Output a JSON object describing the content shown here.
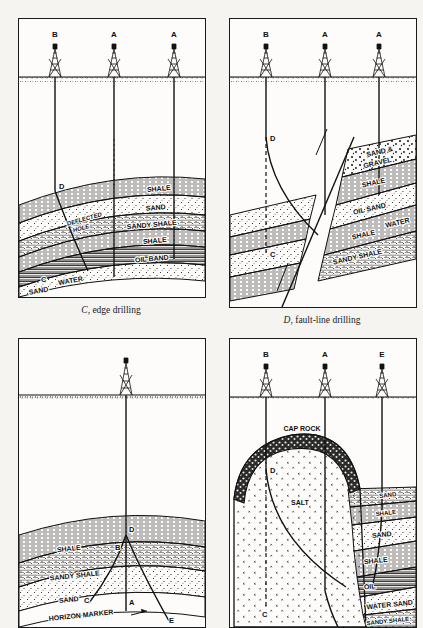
{
  "figure": {
    "kind": "geological-cross-section-plate",
    "panels": [
      {
        "id": "C",
        "caption_letter": "C",
        "caption_text": ", edge drilling",
        "wells": [
          {
            "label": "B",
            "type": "deflected"
          },
          {
            "label": "A",
            "type": "vertical"
          },
          {
            "label": "A",
            "type": "vertical"
          }
        ],
        "point_labels": [
          "D",
          "C"
        ],
        "annotations": [
          "DEFLECTED HOLE"
        ],
        "strata": [
          {
            "name": "SHALE",
            "pattern": "shale"
          },
          {
            "name": "SAND",
            "pattern": "sand"
          },
          {
            "name": "SANDY SHALE",
            "pattern": "sandy-shale"
          },
          {
            "name": "SHALE",
            "pattern": "shale"
          },
          {
            "name": "OIL BAND",
            "pattern": "oil"
          },
          {
            "name": "WATER",
            "pattern": "water"
          },
          {
            "name": "SAND",
            "pattern": "sand"
          }
        ]
      },
      {
        "id": "D",
        "caption_letter": "D",
        "caption_text": ", fault-line drilling",
        "wells": [
          {
            "label": "B",
            "type": "deflected"
          },
          {
            "label": "A",
            "type": "vertical"
          },
          {
            "label": "A",
            "type": "vertical"
          }
        ],
        "point_labels": [
          "D",
          "C"
        ],
        "annotations": [
          "fault plane"
        ],
        "strata": [
          {
            "name": "SAND & GRAVEL",
            "pattern": "gravel"
          },
          {
            "name": "SHALE",
            "pattern": "shale"
          },
          {
            "name": "OIL SAND",
            "pattern": "oil-sand"
          },
          {
            "name": "WATER",
            "pattern": "water"
          },
          {
            "name": "SHALE",
            "pattern": "shale"
          },
          {
            "name": "SANDY SHALE",
            "pattern": "sandy-shale"
          }
        ]
      },
      {
        "id": "E",
        "caption_letter": "",
        "caption_text": "",
        "wells": [
          {
            "label": "",
            "type": "multi-deflected"
          }
        ],
        "point_labels": [
          "D",
          "B",
          "C",
          "A",
          "E"
        ],
        "annotations": [
          "HORIZON MARKER"
        ],
        "strata": [
          {
            "name": "SHALE",
            "pattern": "shale"
          },
          {
            "name": "SANDY SHALE",
            "pattern": "sandy-shale"
          },
          {
            "name": "SAND",
            "pattern": "sand"
          }
        ]
      },
      {
        "id": "F",
        "caption_letter": "",
        "caption_text": "",
        "wells": [
          {
            "label": "B",
            "type": "deflected"
          },
          {
            "label": "A",
            "type": "vertical"
          },
          {
            "label": "E",
            "type": "vertical"
          }
        ],
        "point_labels": [
          "D",
          "C"
        ],
        "annotations": [],
        "strata": [
          {
            "name": "CAP ROCK",
            "pattern": "cap-rock"
          },
          {
            "name": "SALT",
            "pattern": "salt"
          },
          {
            "name": "SAND",
            "pattern": "sand"
          },
          {
            "name": "SHALE",
            "pattern": "shale"
          },
          {
            "name": "SAND",
            "pattern": "sand"
          },
          {
            "name": "SHALE",
            "pattern": "shale"
          },
          {
            "name": "OIL",
            "pattern": "oil"
          },
          {
            "name": "WATER SAND",
            "pattern": "water-sand"
          },
          {
            "name": "SANDY SHALE",
            "pattern": "sandy-shale"
          }
        ]
      }
    ],
    "colors": {
      "ink": "#101010",
      "paper": "#f5f4f1",
      "panel_fill": "#fdfcfa"
    }
  },
  "labels": {
    "shale": "SHALE",
    "sand": "SAND",
    "sandy_shale": "SANDY SHALE",
    "oil_band": "OIL BAND",
    "oil_sand": "OIL SAND",
    "oil": "OIL",
    "water": "WATER",
    "water_sand": "WATER SAND",
    "sand_gravel": "SAND &",
    "gravel": "GRAVEL",
    "cap_rock": "CAP ROCK",
    "salt": "SALT",
    "horizon_marker": "HORIZON MARKER",
    "deflected": "DEFLECTED",
    "hole": "HOLE",
    "well_a": "A",
    "well_b": "B",
    "well_e": "E",
    "pt_a": "A",
    "pt_b": "B",
    "pt_c": "C",
    "pt_d": "D",
    "pt_e": "E"
  },
  "captions": {
    "c_letter": "C",
    "c_rest": ", edge drilling",
    "d_letter": "D",
    "d_rest": ", fault-line drilling"
  }
}
